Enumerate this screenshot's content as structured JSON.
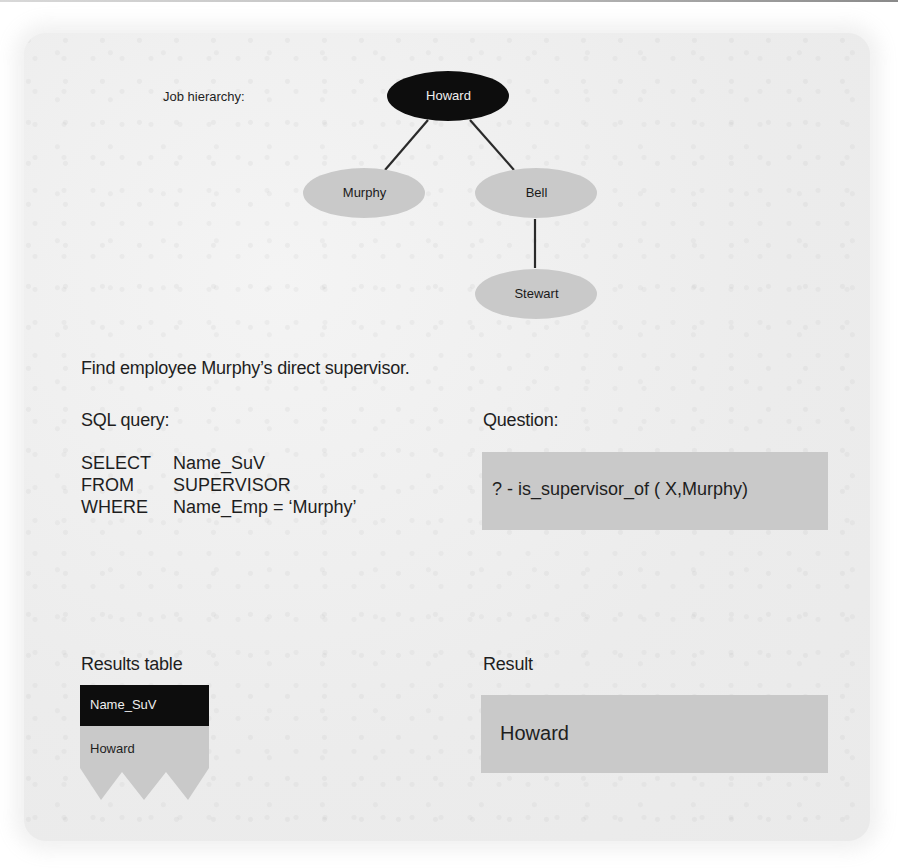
{
  "diagram": {
    "hierarchy_label": "Job hierarchy:",
    "nodes": [
      {
        "id": "howard",
        "label": "Howard",
        "level": 0,
        "highlighted": true
      },
      {
        "id": "murphy",
        "label": "Murphy",
        "level": 1,
        "parent": "howard"
      },
      {
        "id": "bell",
        "label": "Bell",
        "level": 1,
        "parent": "howard"
      },
      {
        "id": "stewart",
        "label": "Stewart",
        "level": 2,
        "parent": "bell"
      }
    ],
    "edges": [
      {
        "from": "howard",
        "to": "murphy"
      },
      {
        "from": "howard",
        "to": "bell"
      },
      {
        "from": "bell",
        "to": "stewart"
      }
    ]
  },
  "task": {
    "statement": "Find employee Murphy’s direct supervisor."
  },
  "sql": {
    "heading": "SQL query:",
    "lines": [
      {
        "keyword": "SELECT",
        "value": "Name_SuV"
      },
      {
        "keyword": "FROM",
        "value": "SUPERVISOR"
      },
      {
        "keyword": "WHERE",
        "value": "Name_Emp = ‘Murphy’"
      }
    ]
  },
  "question": {
    "heading": "Question:",
    "query": "? - is_supervisor_of ( X,Murphy)"
  },
  "results_table": {
    "heading": "Results table",
    "columns": [
      "Name_SuV"
    ],
    "rows": [
      [
        "Howard"
      ]
    ]
  },
  "result": {
    "heading": "Result",
    "value": "Howard"
  },
  "colors": {
    "panel_background": "#efefef",
    "highlight_node": "#0d0d0d",
    "node_fill": "#c9c9c9",
    "box_fill": "#c9c9c9",
    "edge": "#2a2a2a"
  }
}
